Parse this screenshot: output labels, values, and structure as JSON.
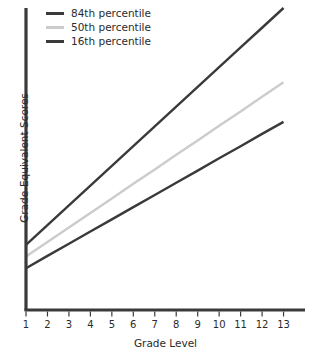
{
  "chart_data": {
    "type": "line",
    "title": "",
    "xlabel": "Grade Level",
    "ylabel": "Grade-Equivalent Scores",
    "x": [
      1,
      2,
      3,
      4,
      5,
      6,
      7,
      8,
      9,
      10,
      11,
      12,
      13
    ],
    "xticklabels": [
      "1",
      "2",
      "3",
      "4",
      "5",
      "6",
      "7",
      "8",
      "9",
      "10",
      "11",
      "12",
      "13"
    ],
    "xlim": [
      1,
      14
    ],
    "ylim": [
      0,
      13
    ],
    "yticklabels": [],
    "grid": false,
    "legend_position": "top-left",
    "series": [
      {
        "name": "84th percentile",
        "color": "#3a3a3a",
        "values": [
          2.8,
          3.65,
          4.5,
          5.35,
          6.2,
          7.05,
          7.9,
          8.75,
          9.6,
          10.45,
          11.3,
          12.15,
          13.0
        ]
      },
      {
        "name": "50th percentile",
        "color": "#cccccc",
        "values": [
          2.3,
          2.93,
          3.55,
          4.18,
          4.8,
          5.43,
          6.05,
          6.68,
          7.3,
          7.93,
          8.55,
          9.18,
          9.8
        ]
      },
      {
        "name": "16th percentile",
        "color": "#3a3a3a",
        "values": [
          1.8,
          2.33,
          2.85,
          3.38,
          3.9,
          4.43,
          4.95,
          5.48,
          6.0,
          6.53,
          7.05,
          7.58,
          8.1
        ]
      }
    ],
    "annotations": []
  },
  "legend": {
    "items": [
      {
        "label": "84th percentile"
      },
      {
        "label": "50th percentile"
      },
      {
        "label": "16th percentile"
      }
    ]
  },
  "axes": {
    "x_title": "Grade Level",
    "y_title": "Grade-Equivalent Scores",
    "axis_color": "#3a3a3a"
  }
}
